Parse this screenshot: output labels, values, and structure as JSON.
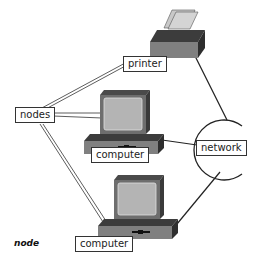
{
  "labels": {
    "printer": "printer",
    "nodes": "nodes",
    "network": "network",
    "computer_1": "computer",
    "computer_2": "computer"
  },
  "caption": "node",
  "colors": {
    "device_dark": "#3c3c3c",
    "device_mid": "#808080",
    "screen": "#b4b4b4",
    "paper": "#c8c8c8",
    "line": "#222222"
  },
  "devices": [
    {
      "type": "printer",
      "label": "printer"
    },
    {
      "type": "computer",
      "label": "computer"
    },
    {
      "type": "computer",
      "label": "computer"
    }
  ],
  "connections": [
    {
      "from": "printer",
      "to": "network"
    },
    {
      "from": "computer_1",
      "to": "network"
    },
    {
      "from": "computer_2",
      "to": "network"
    },
    {
      "from": "nodes",
      "to": "printer"
    },
    {
      "from": "nodes",
      "to": "computer_1"
    },
    {
      "from": "nodes",
      "to": "computer_2"
    }
  ]
}
